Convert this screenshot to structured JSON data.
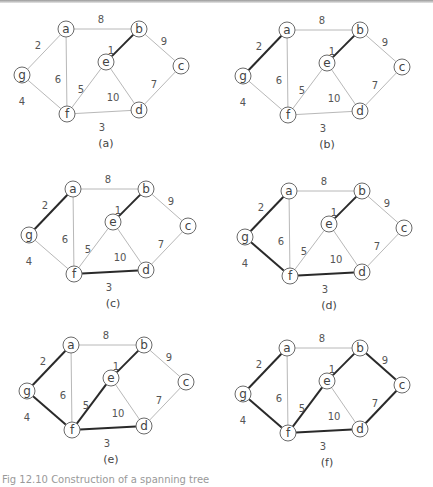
{
  "figure": {
    "caption_partial": "Fig 12.10 Construction of a spanning tree",
    "mst_edge_color": "#2a2a2a",
    "edge_color": "#b8b8b8"
  },
  "graph": {
    "nodes": [
      {
        "id": "a",
        "dx": 0,
        "dy": 0
      },
      {
        "id": "b",
        "dx": 73,
        "dy": 0
      },
      {
        "id": "c",
        "dx": 115,
        "dy": 37
      },
      {
        "id": "e",
        "dx": 40,
        "dy": 33
      },
      {
        "id": "g",
        "dx": -44,
        "dy": 46
      },
      {
        "id": "f",
        "dx": 1,
        "dy": 85
      },
      {
        "id": "d",
        "dx": 73,
        "dy": 81
      }
    ],
    "edges": [
      {
        "u": "a",
        "v": "b",
        "w": "8",
        "lx": 35,
        "ly": -10
      },
      {
        "u": "a",
        "v": "g",
        "w": "2",
        "lx": -28,
        "ly": 16
      },
      {
        "u": "a",
        "v": "f",
        "w": "6",
        "lx": -8,
        "ly": 50
      },
      {
        "u": "b",
        "v": "e",
        "w": "1",
        "lx": 45,
        "ly": 21
      },
      {
        "u": "b",
        "v": "c",
        "w": "9",
        "lx": 98,
        "ly": 12
      },
      {
        "u": "e",
        "v": "f",
        "w": "5",
        "lx": 15,
        "ly": 60
      },
      {
        "u": "e",
        "v": "d",
        "w": "10",
        "lx": 47,
        "ly": 68
      },
      {
        "u": "c",
        "v": "d",
        "w": "7",
        "lx": 88,
        "ly": 55
      },
      {
        "u": "g",
        "v": "f",
        "w": "4",
        "lx": -44,
        "ly": 72
      },
      {
        "u": "f",
        "v": "d",
        "w": "3",
        "lx": 36,
        "ly": 98
      }
    ]
  },
  "panels": [
    {
      "label": "(a)",
      "ax": 66,
      "ay": 29,
      "mst": [
        "b-e"
      ]
    },
    {
      "label": "(b)",
      "ax": 287,
      "ay": 30,
      "mst": [
        "b-e",
        "a-g"
      ]
    },
    {
      "label": "(c)",
      "ax": 73,
      "ay": 189,
      "mst": [
        "b-e",
        "a-g",
        "f-d"
      ]
    },
    {
      "label": "(d)",
      "ax": 289,
      "ay": 191,
      "mst": [
        "b-e",
        "a-g",
        "f-d",
        "g-f"
      ]
    },
    {
      "label": "(e)",
      "ax": 71,
      "ay": 345,
      "mst": [
        "b-e",
        "a-g",
        "f-d",
        "g-f",
        "e-f"
      ]
    },
    {
      "label": "(f)",
      "ax": 287,
      "ay": 348,
      "mst": [
        "b-e",
        "a-g",
        "f-d",
        "g-f",
        "e-f",
        "c-d",
        "b-c"
      ]
    }
  ]
}
